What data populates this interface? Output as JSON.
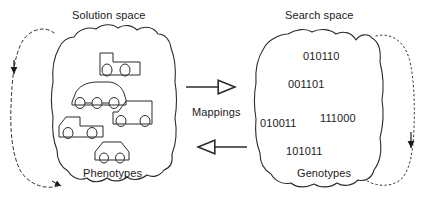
{
  "diagram": {
    "type": "concept-diagram",
    "title_left": "Solution space",
    "title_right": "Search space",
    "label_left_bottom": "Phenotypes",
    "label_right_bottom": "Genotypes",
    "mappings_label": "Mappings",
    "line_color": "#2b2b2b",
    "text_color": "#1a1a1a",
    "background": "#ffffff"
  },
  "left_space": {
    "title": "Solution space",
    "inner_label": "Phenotypes",
    "items": [
      {
        "name": "tractor",
        "label": "tractor"
      },
      {
        "name": "sedan-three-wheel",
        "label": "car"
      },
      {
        "name": "van",
        "label": "van"
      },
      {
        "name": "pickup-truck",
        "label": "pickup"
      },
      {
        "name": "compact-car",
        "label": "compact"
      }
    ]
  },
  "right_space": {
    "title": "Search space",
    "inner_label": "Genotypes",
    "genotypes": [
      {
        "value": "010110"
      },
      {
        "value": "001101"
      },
      {
        "value": "010011"
      },
      {
        "value": "111000"
      },
      {
        "value": "101011"
      }
    ]
  },
  "arrows": {
    "forward_label": "Mappings",
    "forward_direction": "right",
    "reverse_direction": "left",
    "loop_left_style": "dashed",
    "loop_right_style": "dotted"
  }
}
